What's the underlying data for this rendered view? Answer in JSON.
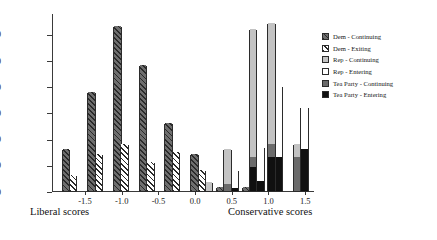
{
  "chart_data": {
    "type": "bar",
    "title": "",
    "subtitle": "",
    "xlabel_left": "Liberal scores",
    "xlabel_right": "Conservative scores",
    "ylabel": "",
    "xlim": [
      -1.95,
      1.62
    ],
    "ylim": [
      0,
      68
    ],
    "grid": false,
    "legend_position": "right",
    "xticks": [
      "-1.5",
      "-1.0",
      "-0.5",
      "0.0",
      "0.5",
      "1.0",
      "1.5"
    ],
    "xtick_values": [
      -1.5,
      -1.0,
      -0.5,
      0.0,
      0.5,
      1.0,
      1.5
    ],
    "yticks": [
      "0",
      "10",
      "20",
      "30",
      "40",
      "50",
      "60"
    ],
    "ytick_values": [
      0,
      10,
      20,
      30,
      40,
      50,
      60
    ],
    "series": [
      {
        "name": "Dem - Continuing",
        "key": "dem_cont",
        "color": "#6e6e6e",
        "pattern": "hatch-dark"
      },
      {
        "name": "Dem - Exiting",
        "key": "dem_exit",
        "color": "#ffffff",
        "pattern": "hatch-light"
      },
      {
        "name": "Rep - Continuing",
        "key": "rep_cont",
        "color": "#c3c3c3",
        "pattern": "solid"
      },
      {
        "name": "Rep - Entering",
        "key": "rep_ent",
        "color": "#ffffff",
        "pattern": "solid"
      },
      {
        "name": "Tea Party - Continuing",
        "key": "tp_cont",
        "color": "#6b6b6b",
        "pattern": "solid"
      },
      {
        "name": "Tea Party - Entering",
        "key": "tp_ent",
        "color": "#101010",
        "pattern": "solid"
      }
    ],
    "bars": [
      {
        "x": -1.76,
        "series": "dem_cont",
        "total": 16,
        "segments": [
          {
            "key": "dem_cont",
            "value": 16
          }
        ]
      },
      {
        "x": -1.66,
        "series": "dem_exit",
        "total": 6,
        "segments": [
          {
            "key": "dem_exit",
            "value": 6
          }
        ]
      },
      {
        "x": -1.41,
        "series": "dem_cont",
        "total": 38,
        "segments": [
          {
            "key": "dem_cont",
            "value": 38
          }
        ]
      },
      {
        "x": -1.31,
        "series": "dem_exit",
        "total": 14,
        "segments": [
          {
            "key": "dem_exit",
            "value": 14
          }
        ]
      },
      {
        "x": -1.06,
        "series": "dem_cont",
        "total": 63,
        "segments": [
          {
            "key": "dem_cont",
            "value": 63
          }
        ]
      },
      {
        "x": -0.96,
        "series": "dem_exit",
        "total": 18,
        "segments": [
          {
            "key": "dem_exit",
            "value": 18
          }
        ]
      },
      {
        "x": -0.71,
        "series": "dem_cont",
        "total": 48,
        "segments": [
          {
            "key": "dem_cont",
            "value": 48
          }
        ]
      },
      {
        "x": -0.61,
        "series": "dem_exit",
        "total": 11,
        "segments": [
          {
            "key": "dem_exit",
            "value": 11
          }
        ]
      },
      {
        "x": -0.36,
        "series": "dem_cont",
        "total": 26,
        "segments": [
          {
            "key": "dem_cont",
            "value": 26
          }
        ]
      },
      {
        "x": -0.26,
        "series": "dem_exit",
        "total": 15,
        "segments": [
          {
            "key": "dem_exit",
            "value": 15
          }
        ]
      },
      {
        "x": -0.01,
        "series": "dem_cont",
        "total": 14,
        "segments": [
          {
            "key": "dem_cont",
            "value": 14
          }
        ]
      },
      {
        "x": 0.09,
        "series": "dem_exit",
        "total": 8,
        "segments": [
          {
            "key": "dem_exit",
            "value": 8
          }
        ]
      },
      {
        "x": 0.19,
        "series": "rep_cont",
        "total": 3.5,
        "segments": [
          {
            "key": "rep_cont",
            "value": 3.5
          }
        ]
      },
      {
        "x": 0.34,
        "series": "dem_cont",
        "total": 1.5,
        "segments": [
          {
            "key": "dem_cont",
            "value": 1.5
          }
        ]
      },
      {
        "x": 0.44,
        "series": "rep_cont",
        "total": 16,
        "segments": [
          {
            "key": "tp_cont",
            "value": 2.5
          },
          {
            "key": "rep_cont",
            "value": 13.5
          }
        ]
      },
      {
        "x": 0.54,
        "series": "rep_ent",
        "total": 8,
        "segments": [
          {
            "key": "tp_ent",
            "value": 1.2
          },
          {
            "key": "rep_ent",
            "value": 6.8
          }
        ]
      },
      {
        "x": 0.69,
        "series": "dem_cont",
        "total": 1.5,
        "segments": [
          {
            "key": "dem_cont",
            "value": 1.5
          }
        ]
      },
      {
        "x": 0.79,
        "series": "rep_cont",
        "total": 62,
        "segments": [
          {
            "key": "tp_ent",
            "value": 9
          },
          {
            "key": "tp_cont",
            "value": 4
          },
          {
            "key": "rep_cont",
            "value": 49
          }
        ]
      },
      {
        "x": 0.89,
        "series": "rep_ent",
        "total": 17,
        "segments": [
          {
            "key": "tp_ent",
            "value": 4
          },
          {
            "key": "rep_ent",
            "value": 13
          }
        ]
      },
      {
        "x": 1.04,
        "series": "rep_cont",
        "total": 64,
        "segments": [
          {
            "key": "tp_ent",
            "value": 13
          },
          {
            "key": "tp_cont",
            "value": 5
          },
          {
            "key": "rep_cont",
            "value": 46
          }
        ]
      },
      {
        "x": 1.14,
        "series": "rep_ent",
        "total": 40,
        "segments": [
          {
            "key": "tp_ent",
            "value": 13
          },
          {
            "key": "rep_ent",
            "value": 27
          }
        ]
      },
      {
        "x": 1.39,
        "series": "rep_cont",
        "total": 18,
        "segments": [
          {
            "key": "tp_cont",
            "value": 13
          },
          {
            "key": "rep_cont",
            "value": 5
          }
        ]
      },
      {
        "x": 1.49,
        "series": "rep_ent",
        "total": 32,
        "segments": [
          {
            "key": "tp_ent",
            "value": 16
          },
          {
            "key": "rep_ent",
            "value": 16
          }
        ]
      }
    ]
  },
  "legend": {
    "items": [
      {
        "label": "Dem - Continuing",
        "swatch": "p-dem-cont"
      },
      {
        "label": "Dem - Exiting",
        "swatch": "p-dem-exit"
      },
      {
        "label": "Rep - Continuing",
        "swatch": "p-rep-cont"
      },
      {
        "label": "Rep - Entering",
        "swatch": "p-rep-ent"
      },
      {
        "label": "Tea Party - Continuing",
        "swatch": "p-tp-cont"
      },
      {
        "label": "Tea Party - Entering",
        "swatch": "p-tp-ent"
      }
    ]
  }
}
